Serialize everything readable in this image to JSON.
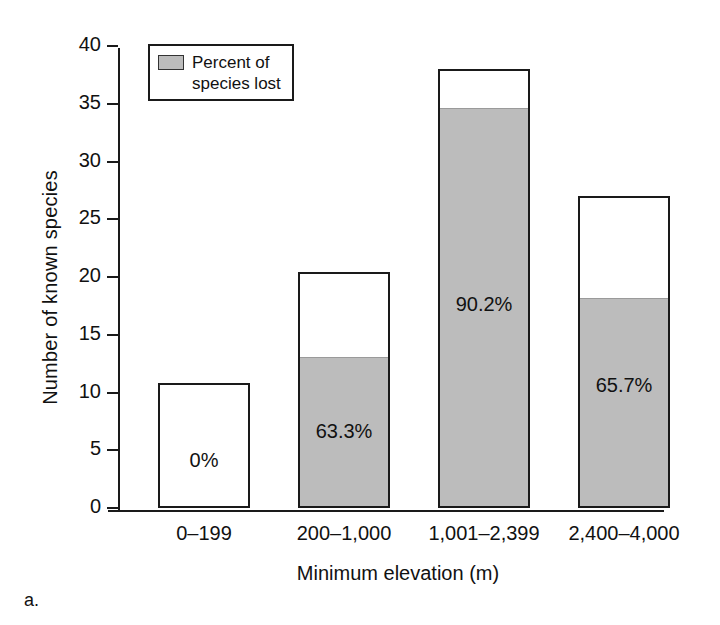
{
  "figure": {
    "letter": "a."
  },
  "legend": {
    "label": "Percent of\nspecies lost",
    "label_line1": "Percent of",
    "label_line2": "species lost",
    "swatch_color": "#bcbcbc"
  },
  "axes": {
    "ylabel": "Number of known species",
    "xlabel": "Minimum elevation (m)",
    "yticks": [
      0,
      5,
      10,
      15,
      20,
      25,
      30,
      35,
      40
    ],
    "ylim": [
      0,
      40
    ]
  },
  "chart_data": {
    "type": "bar",
    "title": "",
    "subtitle": "",
    "xlabel": "Minimum elevation (m)",
    "ylabel": "Number of known species",
    "ylim": [
      0,
      40
    ],
    "yticks": [
      0,
      5,
      10,
      15,
      20,
      25,
      30,
      35,
      40
    ],
    "grid": false,
    "legend_position": "top-left",
    "categories": [
      "0–199",
      "200–1,000",
      "1,001–2,399",
      "2,400–4,000"
    ],
    "series": [
      {
        "name": "Number of known species",
        "values": [
          10.8,
          20.4,
          38.0,
          27.0
        ]
      },
      {
        "name": "Percent of species lost",
        "values": [
          0.0,
          12.9,
          34.5,
          18.0
        ]
      }
    ],
    "annotations": [
      "0%",
      "63.3%",
      "90.2%",
      "65.7%"
    ],
    "bars": [
      {
        "category": "0–199",
        "total": 10.8,
        "lost_count": 0.0,
        "percent_lost_label": "0%",
        "label_value_y": 4.0
      },
      {
        "category": "200–1,000",
        "total": 20.4,
        "lost_count": 12.9,
        "percent_lost_label": "63.3%",
        "label_value_y": 6.5
      },
      {
        "category": "1,001–2,399",
        "total": 38.0,
        "lost_count": 34.5,
        "percent_lost_label": "90.2%",
        "label_value_y": 17.5
      },
      {
        "category": "2,400–4,000",
        "total": 27.0,
        "lost_count": 18.0,
        "percent_lost_label": "65.7%",
        "label_value_y": 10.5
      }
    ]
  },
  "colors": {
    "bar_fill_lost": "#bcbcbc",
    "bar_fill_remaining": "#ffffff",
    "outline": "#1a1a1a",
    "text": "#111111"
  }
}
